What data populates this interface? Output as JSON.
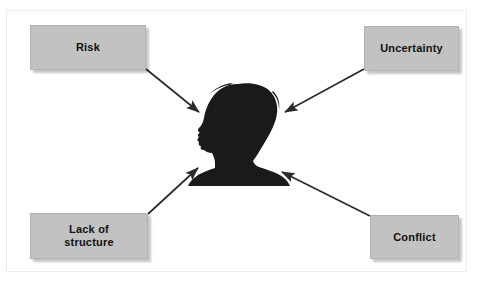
{
  "diagram": {
    "type": "radial-relationship-diagram",
    "center": {
      "name": "person-silhouette",
      "description": "Black silhouette of a person's head and shoulders in left-facing profile with voluminous curly hair",
      "color": "#1a1a1a"
    },
    "nodes": [
      {
        "id": "risk",
        "label": "Risk",
        "position": "top-left",
        "fill": "#c2c2c2",
        "text_color": "#111111"
      },
      {
        "id": "uncertainty",
        "label": "Uncertainty",
        "position": "top-right",
        "fill": "#c2c2c2",
        "text_color": "#111111"
      },
      {
        "id": "lack-of-structure",
        "label": "Lack of\nstructure",
        "label_line1": "Lack of",
        "label_line2": "structure",
        "position": "bottom-left",
        "fill": "#c2c2c2",
        "text_color": "#111111"
      },
      {
        "id": "conflict",
        "label": "Conflict",
        "position": "bottom-right",
        "fill": "#c2c2c2",
        "text_color": "#111111"
      }
    ],
    "connectors": [
      {
        "from": "risk",
        "to": "person-silhouette",
        "style": "solid-arrow",
        "color": "#2b2b2b"
      },
      {
        "from": "uncertainty",
        "to": "person-silhouette",
        "style": "solid-arrow",
        "color": "#2b2b2b"
      },
      {
        "from": "lack-of-structure",
        "to": "person-silhouette",
        "style": "solid-arrow",
        "color": "#2b2b2b"
      },
      {
        "from": "conflict",
        "to": "person-silhouette",
        "style": "solid-arrow",
        "color": "#2b2b2b"
      }
    ],
    "background": "#ffffff"
  }
}
